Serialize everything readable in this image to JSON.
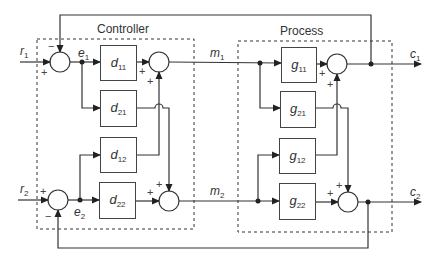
{
  "diagram": {
    "type": "multivariable feedback control block diagram",
    "groups": {
      "controller": {
        "label": "Controller"
      },
      "process": {
        "label": "Process"
      }
    },
    "signals": {
      "r1": {
        "sym": "r",
        "sub": "1"
      },
      "r2": {
        "sym": "r",
        "sub": "2"
      },
      "e1": {
        "sym": "e",
        "sub": "1"
      },
      "e2": {
        "sym": "e",
        "sub": "2"
      },
      "m1": {
        "sym": "m",
        "sub": "1"
      },
      "m2": {
        "sym": "m",
        "sub": "2"
      },
      "c1": {
        "sym": "c",
        "sub": "1"
      },
      "c2": {
        "sym": "c",
        "sub": "2"
      }
    },
    "blocks": {
      "d11": {
        "sym": "d",
        "sub": "11"
      },
      "d21": {
        "sym": "d",
        "sub": "21"
      },
      "d12": {
        "sym": "d",
        "sub": "12"
      },
      "d22": {
        "sym": "d",
        "sub": "22"
      },
      "g11": {
        "sym": "g",
        "sub": "11"
      },
      "g21": {
        "sym": "g",
        "sub": "21"
      },
      "g12": {
        "sym": "g",
        "sub": "12"
      },
      "g22": {
        "sym": "g",
        "sub": "22"
      }
    },
    "signs": {
      "plus": "+",
      "minus": "−"
    },
    "connections": [
      "r1 (+) and c1 feedback (−) -> sum1 -> e1",
      "e1 -> d11 -> sum3 (+)",
      "e1 -> d21 -> sum4 (+)",
      "r2 (+) and c2 feedback (−) -> sum2 -> e2",
      "e2 -> d12 -> sum3 (+)",
      "e2 -> d22 -> sum4 (+)",
      "sum3 -> m1",
      "sum4 -> m2",
      "m1 -> g11 -> sum5 (+)",
      "m1 -> g21 -> sum6 (+)",
      "m2 -> g12 -> sum5 (+)",
      "m2 -> g22 -> sum6 (+)",
      "sum5 -> c1",
      "sum6 -> c2"
    ]
  }
}
